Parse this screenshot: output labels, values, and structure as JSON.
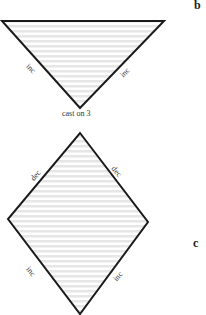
{
  "figures": [
    {
      "id": "b",
      "letter": "b",
      "shape": "inverted-triangle",
      "edge_labels": {
        "left": "inc",
        "right": "inc"
      },
      "bottom_label": "cast on 3"
    },
    {
      "id": "c",
      "letter": "c",
      "shape": "diamond",
      "edge_labels": {
        "upper_left": "dec",
        "upper_right": "dec",
        "lower_left": "inc",
        "lower_right": "inc"
      }
    }
  ],
  "colors": {
    "stroke": "#1a1a1a",
    "stripe": "#e6e6e6",
    "background": "#ffffff"
  }
}
